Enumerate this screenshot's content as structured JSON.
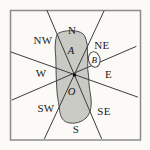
{
  "diagram": {
    "type": "compass-sector-region-diagram",
    "compass_labels": {
      "n": "N",
      "ne": "NE",
      "e": "E",
      "se": "SE",
      "s": "S",
      "sw": "SW",
      "w": "W",
      "nw": "NW"
    },
    "point_labels": {
      "a": "A",
      "o": "O",
      "b": "B"
    },
    "colors": {
      "background": "#fbfaf6",
      "frame_border": "#8c8c8c",
      "region_fill": "#c9cac4",
      "region_stroke": "#4a4a48",
      "line": "#3c3c3c",
      "text": "#1c1c1c",
      "b_oval_fill": "#fbfaf6"
    }
  }
}
